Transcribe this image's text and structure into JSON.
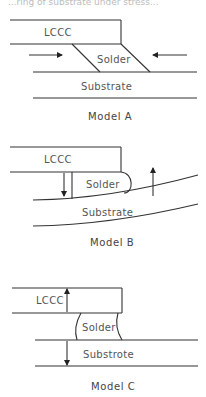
{
  "header_fragment": "...ring of substrate under stress...",
  "models": [
    {
      "caption": "Model A",
      "labels": {
        "component": "LCCC",
        "joint": "Solder",
        "base": "Substrate"
      },
      "arrows": [
        "right-pointing (compression from left)",
        "left-pointing (compression from right)"
      ]
    },
    {
      "caption": "Model B",
      "labels": {
        "component": "LCCC",
        "joint": "Solder",
        "base": "Substrate"
      },
      "arrows": [
        "down-pointing at component",
        "up-pointing at bent substrate"
      ]
    },
    {
      "caption": "Model C",
      "labels": {
        "component": "LCCC",
        "joint": "Solder",
        "base": "Substrote"
      },
      "arrows": [
        "up-pointing at component",
        "down-pointing at substrate"
      ]
    }
  ],
  "colors": {
    "line": "#333333",
    "text": "#555555",
    "background": "#ffffff"
  }
}
